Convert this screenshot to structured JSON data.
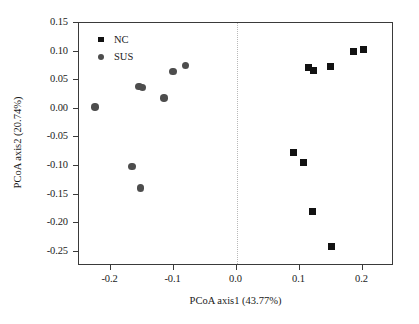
{
  "chart_data": {
    "type": "scatter",
    "title": "",
    "xlabel": "PCoA axis1 (43.77%)",
    "ylabel": "PCoA axis2 (20.74%)",
    "xlim": [
      -0.25,
      0.25
    ],
    "ylim": [
      -0.275,
      0.15
    ],
    "grid": false,
    "legend_position": "top-left",
    "xticks": [
      -0.2,
      -0.1,
      0.0,
      0.1,
      0.2
    ],
    "xticklabels": [
      "-0.2",
      "-0.1",
      "0.0",
      "0.1",
      "0.2"
    ],
    "yticks": [
      0.15,
      0.1,
      0.05,
      0.0,
      -0.05,
      -0.1,
      -0.15,
      -0.2,
      -0.25
    ],
    "yticklabels": [
      "0.15",
      "0.10",
      "0.05",
      "0.00",
      "-0.05",
      "-0.10",
      "-0.15",
      "-0.20",
      "-0.25"
    ],
    "annotations": [
      {
        "name": "zero-vertical-reference-line",
        "x": 0.0,
        "style": "dotted",
        "color": "#b9b9b9"
      }
    ],
    "series": [
      {
        "name": "NC",
        "marker": "square",
        "color": "#121212",
        "points": [
          {
            "x": 0.09,
            "y": -0.076
          },
          {
            "x": 0.107,
            "y": -0.094
          },
          {
            "x": 0.115,
            "y": 0.072
          },
          {
            "x": 0.122,
            "y": 0.067
          },
          {
            "x": 0.121,
            "y": -0.18
          },
          {
            "x": 0.15,
            "y": -0.241
          },
          {
            "x": 0.149,
            "y": 0.074
          },
          {
            "x": 0.185,
            "y": 0.1
          },
          {
            "x": 0.202,
            "y": 0.104
          }
        ]
      },
      {
        "name": "SUS",
        "marker": "circle",
        "color": "#4d4d4d",
        "points": [
          {
            "x": -0.225,
            "y": 0.003
          },
          {
            "x": -0.166,
            "y": -0.101
          },
          {
            "x": -0.155,
            "y": 0.039
          },
          {
            "x": -0.149,
            "y": 0.037
          },
          {
            "x": -0.152,
            "y": -0.139
          },
          {
            "x": -0.115,
            "y": 0.019
          },
          {
            "x": -0.101,
            "y": 0.065
          },
          {
            "x": -0.081,
            "y": 0.076
          }
        ]
      }
    ]
  },
  "legend": {
    "entries": [
      {
        "label": "NC",
        "marker": "square"
      },
      {
        "label": "SUS",
        "marker": "circle"
      }
    ]
  }
}
